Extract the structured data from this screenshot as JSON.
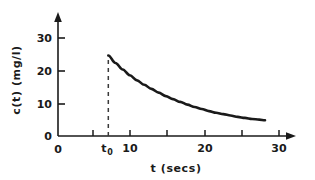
{
  "chart_data": {
    "type": "line",
    "title": "",
    "xlabel": "t (secs)",
    "ylabel": "c(t) (mg/l)",
    "xlim": [
      0,
      32
    ],
    "ylim": [
      0,
      34
    ],
    "xticks": [
      0,
      5,
      10,
      15,
      20,
      25,
      30
    ],
    "xtick_labels": [
      "0",
      "",
      "10",
      "",
      "20",
      "",
      "30"
    ],
    "yticks": [
      0,
      10,
      20,
      30
    ],
    "ytick_labels": [
      "0",
      "10",
      "20",
      "30"
    ],
    "grid": false,
    "legend": null,
    "annotations": [
      {
        "name": "t0-marker",
        "label": "t",
        "subscript": "0",
        "x": 7,
        "description": "dashed vertical line from x-axis to curve peak"
      }
    ],
    "series": [
      {
        "name": "c(t)",
        "color": "#1a1a1a",
        "x": [
          7,
          8,
          9,
          10,
          11,
          12,
          13,
          14,
          15,
          16,
          17,
          18,
          19,
          20,
          21,
          22,
          23,
          24,
          25,
          26,
          27,
          28,
          28.8
        ],
        "y": [
          23.6,
          21.4,
          19.5,
          17.8,
          16.3,
          15.0,
          13.8,
          12.7,
          11.7,
          10.8,
          10.0,
          9.2,
          8.5,
          7.9,
          7.3,
          6.8,
          6.4,
          6.0,
          5.6,
          5.3,
          5.0,
          4.8,
          4.6
        ]
      }
    ]
  },
  "axis": {
    "x_arrow": true,
    "y_arrow": true,
    "origin_label": "0"
  }
}
